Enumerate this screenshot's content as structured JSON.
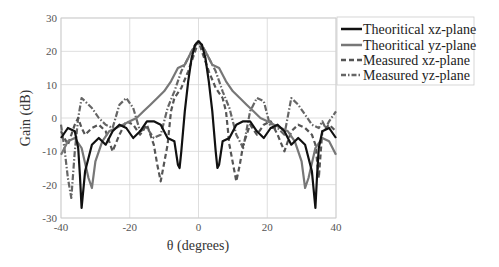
{
  "chart_data": {
    "type": "line",
    "title": "",
    "xlabel": "θ (degrees)",
    "ylabel": "Gain (dB)",
    "xlim": [
      -40,
      40
    ],
    "ylim": [
      -30,
      30
    ],
    "xticks": [
      -40,
      -20,
      0,
      20,
      40
    ],
    "yticks": [
      -30,
      -20,
      -10,
      0,
      10,
      20,
      30
    ],
    "grid": true,
    "legend_position": "upper right (outside)",
    "series": [
      {
        "name": "Theoritical xz-plane",
        "color": "#111111",
        "style": "solid",
        "x": [
          -40,
          -38,
          -36,
          -35,
          -34.5,
          -34,
          -33,
          -31,
          -29,
          -27,
          -25,
          -23,
          -21,
          -19,
          -17,
          -15,
          -13,
          -11,
          -9,
          -7,
          -6,
          -5.5,
          -5,
          -4,
          -3,
          -2,
          -1,
          0,
          1,
          2,
          3,
          4,
          5,
          5.5,
          6,
          7,
          9,
          11,
          13,
          15,
          17,
          19,
          21,
          23,
          25,
          27,
          29,
          31,
          33,
          34,
          34.5,
          35,
          36,
          38,
          40
        ],
        "y": [
          -6,
          -3,
          -4,
          -9,
          -17,
          -27,
          -16,
          -8,
          -6,
          -8,
          -4,
          -2,
          -3,
          -6,
          -4,
          -1,
          -1,
          -2,
          -6,
          -7,
          -14,
          -15,
          -10,
          2,
          11,
          18,
          22,
          23,
          22,
          18,
          11,
          2,
          -10,
          -15,
          -14,
          -7,
          -6,
          -2,
          -1,
          -1,
          -4,
          -6,
          -3,
          -2,
          -4,
          -8,
          -6,
          -8,
          -16,
          -27,
          -17,
          -9,
          -4,
          -3,
          -6
        ]
      },
      {
        "name": "Theoritical yz-plane",
        "color": "#777777",
        "style": "solid",
        "x": [
          -40,
          -38,
          -36,
          -34,
          -32,
          -31,
          -30,
          -28,
          -26,
          -24,
          -22,
          -20,
          -18,
          -16,
          -14,
          -12,
          -10,
          -8,
          -6,
          -4,
          -2,
          0,
          2,
          4,
          6,
          8,
          10,
          12,
          14,
          16,
          18,
          20,
          22,
          24,
          26,
          28,
          30,
          31,
          32,
          34,
          36,
          38,
          40
        ],
        "y": [
          -11,
          -7,
          -6,
          -9,
          -18,
          -21,
          -13,
          -7,
          -4,
          -3,
          -2,
          -1,
          0,
          2,
          4,
          6,
          8,
          11,
          15,
          16,
          20,
          23,
          20,
          16,
          15,
          11,
          8,
          6,
          4,
          2,
          0,
          -1,
          -2,
          -3,
          -4,
          -7,
          -13,
          -21,
          -18,
          -9,
          -6,
          -7,
          -11
        ]
      },
      {
        "name": "Measured xz-plane",
        "color": "#555555",
        "style": "dashed",
        "x": [
          -40,
          -38,
          -36,
          -35,
          -34,
          -33,
          -31,
          -29,
          -27,
          -25,
          -23,
          -21,
          -19,
          -17,
          -15,
          -13,
          -12,
          -11,
          -9,
          -8,
          -7,
          -5,
          -3,
          -1,
          0,
          1,
          3,
          5,
          7,
          8,
          9,
          11,
          12,
          13,
          15,
          17,
          19,
          21,
          23,
          25,
          27,
          29,
          31,
          33,
          34,
          35,
          36,
          38,
          40
        ],
        "y": [
          -4,
          -8,
          -2,
          0,
          -3,
          -5,
          -3,
          -2,
          -4,
          -10,
          -5,
          -1,
          -2,
          -5,
          -2,
          -8,
          -14,
          -19,
          -8,
          2,
          6,
          9,
          14,
          20,
          23,
          20,
          14,
          9,
          6,
          2,
          -8,
          -19,
          -14,
          -8,
          -2,
          -5,
          -2,
          -1,
          -5,
          -10,
          -4,
          -2,
          -3,
          -5,
          -8,
          -18,
          -4,
          -2,
          -4
        ]
      },
      {
        "name": "Measured yz-plane",
        "color": "#666666",
        "style": "dashdot",
        "x": [
          -40,
          -39,
          -38,
          -37,
          -36,
          -35,
          -34,
          -33,
          -31,
          -29,
          -27,
          -25,
          -23,
          -21,
          -19,
          -17,
          -15,
          -13,
          -11,
          -9,
          -7,
          -5,
          -3,
          -1,
          0,
          1,
          3,
          5,
          7,
          9,
          11,
          13,
          15,
          17,
          19,
          21,
          23,
          25,
          27,
          29,
          31,
          33,
          35,
          36,
          37,
          38,
          40
        ],
        "y": [
          -2,
          -9,
          -18,
          -24,
          -10,
          0,
          6,
          5,
          3,
          0,
          -2,
          -3,
          4,
          6,
          3,
          -4,
          -3,
          -6,
          -5,
          3,
          8,
          14,
          18,
          22,
          23,
          22,
          18,
          14,
          8,
          3,
          -5,
          -9,
          2,
          6,
          5,
          -3,
          -3,
          -5,
          6,
          4,
          1,
          -2,
          -3,
          -1,
          -3,
          -1,
          2
        ]
      }
    ]
  },
  "legend": {
    "items": [
      {
        "label": "Theoritical xz-plane"
      },
      {
        "label": "Theoritical yz-plane"
      },
      {
        "label": "Measured xz-plane"
      },
      {
        "label": "Measured yz-plane"
      }
    ]
  }
}
